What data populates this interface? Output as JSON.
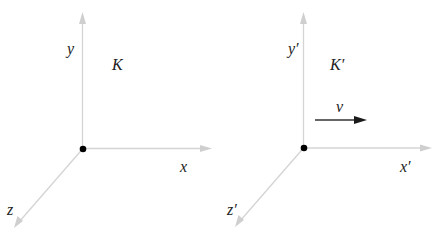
{
  "diagram": {
    "colors": {
      "axis": "#d4d4d4",
      "origin": "#000000",
      "velocity_arrow": "#1a1a1a",
      "label": "#222222",
      "background": "#ffffff"
    },
    "frames": [
      {
        "name": "K",
        "frame_label": "K",
        "axes": {
          "x": "x",
          "y": "y",
          "z": "z"
        }
      },
      {
        "name": "K'",
        "frame_label": "K′",
        "axes": {
          "x": "x′",
          "y": "y′",
          "z": "z′"
        },
        "velocity_label": "v"
      }
    ]
  }
}
